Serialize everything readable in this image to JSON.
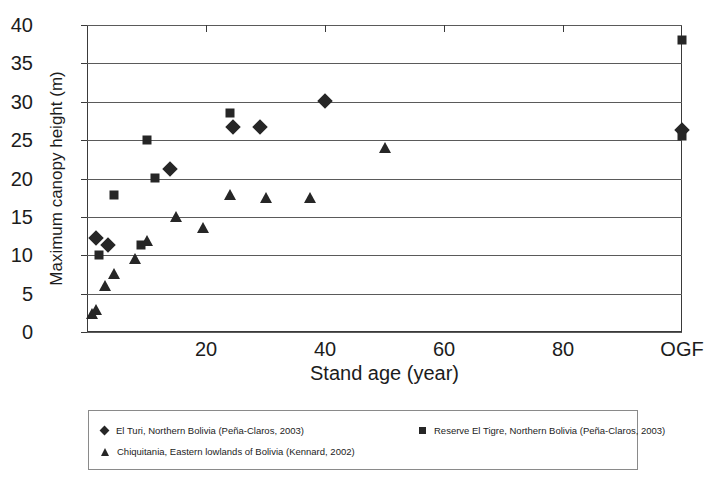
{
  "chart_data": {
    "type": "scatter",
    "title": "",
    "xlabel": "Stand age (year)",
    "ylabel": "Maximum canopy height (m)",
    "xlim": [
      0,
      100
    ],
    "ylim": [
      0,
      40
    ],
    "xticks": [
      20,
      40,
      60,
      80,
      100
    ],
    "xtick_labels": [
      "20",
      "40",
      "60",
      "80",
      "OGF"
    ],
    "yticks": [
      0,
      5,
      10,
      15,
      20,
      25,
      30,
      35,
      40
    ],
    "ytick_labels": [
      "0",
      "5",
      "10",
      "15",
      "20",
      "25",
      "30",
      "35",
      "40"
    ],
    "grid": "horizontal",
    "legend_position": "below-plot",
    "series": [
      {
        "name": "El Turi, Northern Bolivia (Peña-Claros, 2003)",
        "marker": "diamond",
        "color": "#262626",
        "points": [
          {
            "x": 1.5,
            "y": 12.2
          },
          {
            "x": 3.5,
            "y": 11.3
          },
          {
            "x": 14.0,
            "y": 21.2
          },
          {
            "x": 24.5,
            "y": 26.7
          },
          {
            "x": 29.0,
            "y": 26.7
          },
          {
            "x": 40.0,
            "y": 30.1
          },
          {
            "x": 100.0,
            "y": 26.3
          }
        ]
      },
      {
        "name": "Reserve El Tigre, Northern Bolivia (Peña-Claros, 2003)",
        "marker": "square",
        "color": "#262626",
        "points": [
          {
            "x": 2.0,
            "y": 10.0
          },
          {
            "x": 4.5,
            "y": 17.9
          },
          {
            "x": 9.0,
            "y": 11.4
          },
          {
            "x": 10.0,
            "y": 25.0
          },
          {
            "x": 11.5,
            "y": 20.1
          },
          {
            "x": 24.0,
            "y": 28.5
          },
          {
            "x": 100.0,
            "y": 25.6
          },
          {
            "x": 100.0,
            "y": 38.0
          }
        ]
      },
      {
        "name": "Chiquitania, Eastern lowlands of Bolivia (Kennard, 2002)",
        "marker": "triangle",
        "color": "#262626",
        "points": [
          {
            "x": 0.8,
            "y": 2.3
          },
          {
            "x": 1.5,
            "y": 2.9
          },
          {
            "x": 3.0,
            "y": 6.0
          },
          {
            "x": 4.5,
            "y": 7.6
          },
          {
            "x": 8.0,
            "y": 9.5
          },
          {
            "x": 10.0,
            "y": 11.9
          },
          {
            "x": 15.0,
            "y": 15.0
          },
          {
            "x": 19.5,
            "y": 13.5
          },
          {
            "x": 24.0,
            "y": 17.9
          },
          {
            "x": 30.0,
            "y": 17.4
          },
          {
            "x": 37.5,
            "y": 17.4
          },
          {
            "x": 50.0,
            "y": 24.0
          }
        ]
      }
    ]
  },
  "legend": {
    "entries": [
      {
        "label": "El Turi, Northern Bolivia (Peña-Claros, 2003)",
        "marker": "diamond"
      },
      {
        "label": "Reserve El Tigre, Northern Bolivia (Peña-Claros, 2003)",
        "marker": "square"
      },
      {
        "label": "Chiquitania, Eastern lowlands of Bolivia (Kennard, 2002)",
        "marker": "triangle"
      }
    ]
  }
}
